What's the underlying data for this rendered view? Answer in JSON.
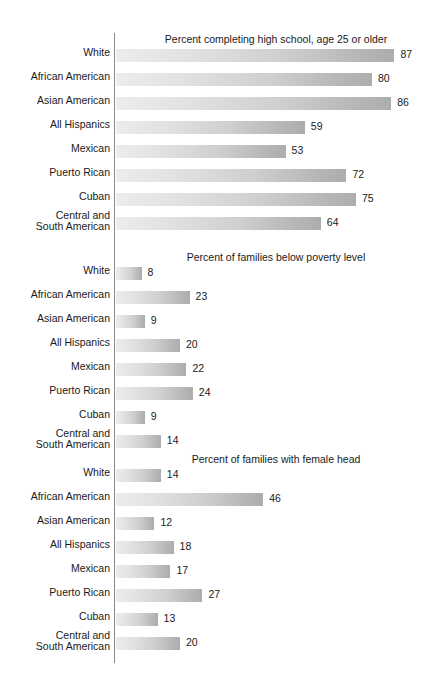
{
  "figure": {
    "axis_color": "#8a8a8a",
    "bar_gradient_start": "#ececec",
    "bar_gradient_end": "#adadad",
    "text_color": "#1a1a1a"
  },
  "categories": [
    "White",
    "African American",
    "Asian American",
    "All Hispanics",
    "Mexican",
    "Puerto Rican",
    "Cuban",
    "Central and\nSouth American"
  ],
  "chart_data": [
    {
      "type": "bar",
      "orientation": "horizontal",
      "title": "Percent completing high school, age 25 or older",
      "xlabel": "",
      "ylabel": "",
      "xlim": [
        0,
        100
      ],
      "grid": false,
      "legend": "none",
      "categories": [
        "White",
        "African American",
        "Asian American",
        "All Hispanics",
        "Mexican",
        "Puerto Rican",
        "Cuban",
        "Central and South American"
      ],
      "values": [
        87,
        80,
        86,
        59,
        53,
        72,
        75,
        64
      ]
    },
    {
      "type": "bar",
      "orientation": "horizontal",
      "title": "Percent of families below poverty level",
      "xlabel": "",
      "ylabel": "",
      "xlim": [
        0,
        100
      ],
      "grid": false,
      "legend": "none",
      "categories": [
        "White",
        "African American",
        "Asian American",
        "All Hispanics",
        "Mexican",
        "Puerto Rican",
        "Cuban",
        "Central and South American"
      ],
      "values": [
        8,
        23,
        9,
        20,
        22,
        24,
        9,
        14
      ]
    },
    {
      "type": "bar",
      "orientation": "horizontal",
      "title": "Percent of families with female head",
      "xlabel": "",
      "ylabel": "",
      "xlim": [
        0,
        100
      ],
      "grid": false,
      "legend": "none",
      "categories": [
        "White",
        "African American",
        "Asian American",
        "All Hispanics",
        "Mexican",
        "Puerto Rican",
        "Cuban",
        "Central and South American"
      ],
      "values": [
        14,
        46,
        12,
        18,
        17,
        27,
        13,
        20
      ]
    }
  ]
}
